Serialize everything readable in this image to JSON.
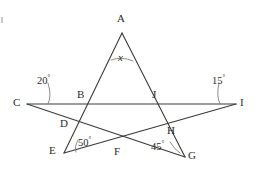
{
  "figure": {
    "type": "geometry-diagram",
    "stroke_color": "#3a3a3a",
    "label_color": "#2b2b2b",
    "background_color": "#ffffff",
    "width": 257,
    "height": 173
  },
  "points": {
    "A": {
      "label": "A",
      "x": 122,
      "y": 33,
      "label_x": 117,
      "label_y": 13
    },
    "B": {
      "label": "B",
      "x": 88,
      "y": 103,
      "label_x": 77,
      "label_y": 89
    },
    "C": {
      "label": "C",
      "x": 27,
      "y": 104,
      "label_x": 14,
      "label_y": 97
    },
    "D": {
      "label": "D",
      "x": 74,
      "y": 121,
      "label_x": 61,
      "label_y": 119
    },
    "E": {
      "label": "E",
      "x": 64,
      "y": 153,
      "label_x": 50,
      "label_y": 145
    },
    "F": {
      "label": "F",
      "x": 119,
      "y": 146,
      "label_x": 114,
      "label_y": 146
    },
    "G": {
      "label": "G",
      "x": 185,
      "y": 157,
      "label_x": 188,
      "label_y": 149
    },
    "H": {
      "label": "H",
      "x": 163,
      "y": 127,
      "label_x": 167,
      "label_y": 125
    },
    "I": {
      "label": "I",
      "x": 236,
      "y": 104,
      "label_x": 240,
      "label_y": 97
    },
    "J": {
      "label": "J",
      "x": 157,
      "y": 103,
      "label_x": 152,
      "label_y": 89
    }
  },
  "lines": [
    {
      "name": "line-C-I",
      "from": "C",
      "to": "I",
      "through": [
        "B",
        "J"
      ]
    },
    {
      "name": "line-A-E",
      "from": "A",
      "to": "E",
      "through": [
        "B",
        "D"
      ]
    },
    {
      "name": "line-A-G",
      "from": "A",
      "to": "G",
      "through": [
        "J",
        "H"
      ]
    },
    {
      "name": "line-C-G",
      "from": "C",
      "to": "G",
      "through": [
        "D",
        "F"
      ]
    },
    {
      "name": "line-E-I",
      "from": "E",
      "to": "I",
      "through": [
        "F",
        "H"
      ]
    }
  ],
  "angles": {
    "apex": {
      "name": "angle-x-at-A",
      "value": "x",
      "vertex": "A",
      "label_x": 116,
      "label_y": 52
    },
    "left": {
      "name": "angle-20-at-C",
      "value": "20",
      "degree": "°",
      "vertex": "C",
      "label_x": 37,
      "label_y": 75
    },
    "right": {
      "name": "angle-15-at-I",
      "value": "15",
      "degree": "°",
      "vertex": "I",
      "label_x": 211,
      "label_y": 75
    },
    "lower_left": {
      "name": "angle-50-at-E",
      "value": "50",
      "degree": "°",
      "vertex": "E",
      "label_x": 77,
      "label_y": 137
    },
    "lower_right": {
      "name": "angle-45-at-G",
      "value": "45",
      "degree": "°",
      "vertex": "G",
      "label_x": 152,
      "label_y": 141
    }
  }
}
